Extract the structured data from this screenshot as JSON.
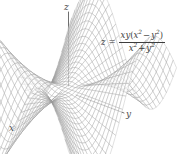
{
  "figure": {
    "type": "3d-surface-wireframe",
    "background_color": "#ffffff",
    "mesh_color": "#8c8c8c",
    "axis_color": "#4a4a4a",
    "text_color": "#3d3d3d"
  },
  "axes": {
    "x_label": "x",
    "y_label": "y",
    "z_label": "z"
  },
  "equation": {
    "lhs": "z",
    "equals": "=",
    "numerator": {
      "prefix": "xy",
      "open_paren": "(",
      "term1_base": "x",
      "term1_exp": "2",
      "operator": "−",
      "term2_base": "y",
      "term2_exp": "2",
      "close_paren": ")"
    },
    "denominator": {
      "term1_base": "x",
      "term1_exp": "2",
      "operator": "+",
      "term2_base": "y",
      "term2_exp": "2"
    },
    "plain_text": "z = xy(x^2 - y^2) / (x^2 + y^2)"
  },
  "chart_data": {
    "type": "surface",
    "title": "",
    "xlabel": "x",
    "ylabel": "y",
    "zlabel": "z",
    "function": "z = xy(x^2 - y^2)/(x^2 + y^2)",
    "xlim": [
      -2,
      2
    ],
    "ylim": [
      -2,
      2
    ],
    "zlim": [
      -1.1,
      1.1
    ],
    "grid": true,
    "legend": null,
    "mesh_lines_u": 33,
    "mesh_lines_v": 33,
    "features": [
      "central saddle at origin",
      "two raised lobes (left-rear and right-rear)",
      "two lowered lobes (front valley and right fold)"
    ]
  }
}
